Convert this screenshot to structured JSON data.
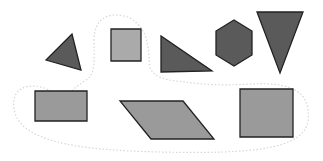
{
  "figure": {
    "width": 323,
    "height": 161,
    "background": "#ffffff",
    "colors": {
      "dark_fill": "#5a5a5a",
      "light_fill": "#aaaaaa",
      "mid_fill": "#9a9a9a",
      "stroke": "#222222",
      "boundary": "#d8d8d8"
    },
    "boundary": {
      "name": "dashed-enclosure",
      "description": "faint dotted closed curve enclosing the light square and the bottom row of quadrilaterals"
    },
    "shapes": [
      {
        "name": "small-triangle",
        "type": "triangle",
        "shade": "dark",
        "points": "46,60 72,34 81,70"
      },
      {
        "name": "small-square",
        "type": "square",
        "shade": "light",
        "points": "111,29 141,29 141,61 111,61"
      },
      {
        "name": "right-triangle",
        "type": "triangle",
        "shade": "dark",
        "points": "161,36 161,72 212,71"
      },
      {
        "name": "hexagon",
        "type": "hexagon",
        "shade": "dark",
        "points": "234,20 252,31 252,55 234,66 216,55 216,31"
      },
      {
        "name": "inverted-triangle",
        "type": "triangle",
        "shade": "dark",
        "points": "257,12 303,12 280,73"
      },
      {
        "name": "rectangle",
        "type": "rectangle",
        "shade": "mid",
        "points": "35,91 87,91 87,121 35,121"
      },
      {
        "name": "parallelogram",
        "type": "parallelogram",
        "shade": "mid",
        "points": "120,101 183,101 214,139 151,139"
      },
      {
        "name": "large-square",
        "type": "square",
        "shade": "mid",
        "points": "240,89 293,89 293,137 240,137"
      }
    ]
  }
}
